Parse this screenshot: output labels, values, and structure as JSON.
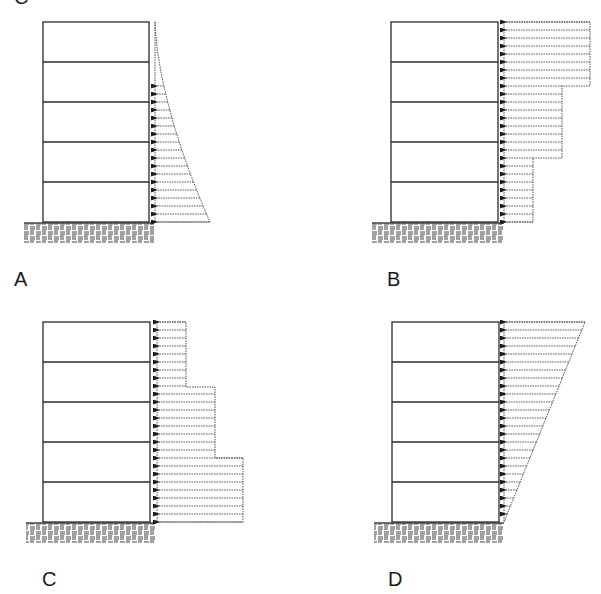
{
  "figure": {
    "partial_top_label": "C",
    "panels": [
      {
        "id": "A",
        "label": "A",
        "load_type": "parabolic-triangular",
        "description": "Load increasing toward base along curved profile",
        "building": {
          "x": 43,
          "y": 22,
          "w": 106,
          "h": 200,
          "floors": 5
        },
        "ground": {
          "x": 24,
          "y": 223,
          "w": 130,
          "h": 20
        },
        "load": {
          "x0": 155,
          "y_top": 22,
          "y_bot": 222,
          "arrow_start_y": 86,
          "max_width": 55
        },
        "label_pos": {
          "x": 14,
          "y": 286
        }
      },
      {
        "id": "B",
        "label": "B",
        "load_type": "stepped-decreasing-downward",
        "description": "Stepped load: widest at top, narrowing toward base",
        "building": {
          "x": 391,
          "y": 22,
          "w": 107,
          "h": 200,
          "floors": 5
        },
        "ground": {
          "x": 372,
          "y": 223,
          "w": 132,
          "h": 20
        },
        "load": {
          "x0": 504,
          "y_top": 22,
          "y_bot": 222,
          "steps": [
            {
              "y0": 22,
              "y1": 86,
              "x1": 590
            },
            {
              "y0": 86,
              "y1": 158,
              "x1": 562
            },
            {
              "y0": 158,
              "y1": 222,
              "x1": 533
            }
          ]
        },
        "label_pos": {
          "x": 387,
          "y": 286
        }
      },
      {
        "id": "C",
        "label": "C",
        "load_type": "stepped-increasing-downward",
        "description": "Stepped load: narrowest at top, widening toward base",
        "building": {
          "x": 43,
          "y": 322,
          "w": 107,
          "h": 200,
          "floors": 5
        },
        "ground": {
          "x": 26,
          "y": 523,
          "w": 130,
          "h": 20
        },
        "load": {
          "x0": 157,
          "y_top": 322,
          "y_bot": 522,
          "steps": [
            {
              "y0": 322,
              "y1": 387,
              "x1": 186
            },
            {
              "y0": 387,
              "y1": 458,
              "x1": 215
            },
            {
              "y0": 458,
              "y1": 522,
              "x1": 243
            }
          ]
        },
        "label_pos": {
          "x": 42,
          "y": 586
        }
      },
      {
        "id": "D",
        "label": "D",
        "load_type": "inverted-triangular",
        "description": "Triangular load: maximum at top, zero at base",
        "building": {
          "x": 392,
          "y": 322,
          "w": 107,
          "h": 200,
          "floors": 5
        },
        "ground": {
          "x": 374,
          "y": 523,
          "w": 130,
          "h": 20
        },
        "load": {
          "x0": 504,
          "y_top": 322,
          "y_bot": 522,
          "x_top_right": 585
        },
        "label_pos": {
          "x": 388,
          "y": 586
        }
      }
    ],
    "colors": {
      "structure": "#2a2a2a",
      "load_lines": "#555555",
      "arrowhead": "#1a1a1a",
      "ground": "#444444",
      "background": "#ffffff"
    },
    "arrow_spacing": 8
  }
}
